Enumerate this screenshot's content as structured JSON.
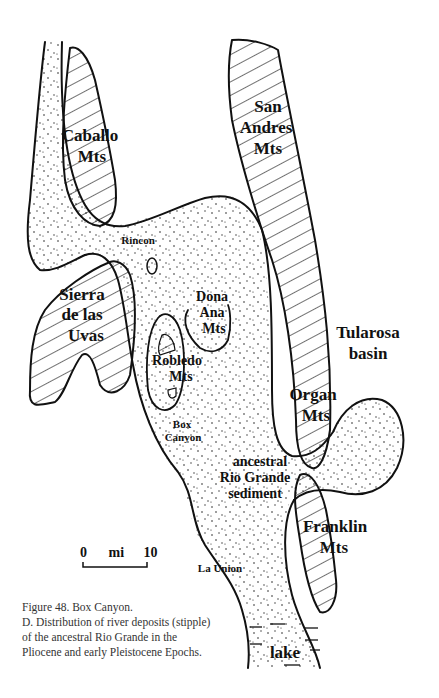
{
  "figure": {
    "caption_title": "Figure 48. Box Canyon.",
    "caption_lines": [
      "D. Distribution of river deposits (stipple)",
      "of the ancestral Rio Grande in the",
      "Pliocene and early Pleistocene Epochs."
    ]
  },
  "map": {
    "mountain_labels": {
      "caballo": [
        "Caballo",
        "Mts"
      ],
      "san_andres": [
        "San",
        "Andres",
        "Mts"
      ],
      "sierra_uvas": [
        "Sierra",
        "de las",
        "Uvas"
      ],
      "dona_ana": [
        "Dona",
        "Ana",
        "Mts"
      ],
      "robledo": [
        "Robledo",
        "Mts"
      ],
      "organ": [
        "Organ",
        "Mts"
      ],
      "franklin": [
        "Franklin",
        "Mts"
      ]
    },
    "place_labels": {
      "rincon": "Rincon",
      "box_canyon": [
        "Box",
        "Canyon"
      ],
      "la_union": "La Union",
      "lake": "lake"
    },
    "region_labels": {
      "tularosa": [
        "Tularosa",
        "basin"
      ],
      "sediment": [
        "ancestral",
        "Rio Grande",
        "sediment"
      ]
    },
    "legend": {
      "stipple_meaning": "river deposits",
      "hatch_meaning": "mountains"
    }
  },
  "scale_bar": {
    "start": "0",
    "unit": "mi",
    "end": "10"
  }
}
